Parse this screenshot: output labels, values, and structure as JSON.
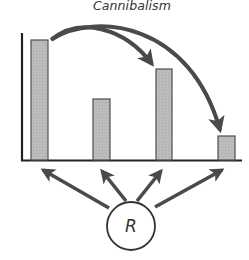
{
  "diagram": {
    "title": "Cannibalism",
    "resource_node": {
      "label": "R"
    },
    "colors": {
      "bar_fill": "#b9b9b9",
      "bar_stroke": "#4f4f4f",
      "arrow": "#4a4a4a",
      "axis": "#222222",
      "text": "#333333"
    },
    "bars": [
      {
        "id": "bar-1",
        "relative_height": 120
      },
      {
        "id": "bar-2",
        "relative_height": 61
      },
      {
        "id": "bar-3",
        "relative_height": 91
      },
      {
        "id": "bar-4",
        "relative_height": 24
      }
    ],
    "curved_arrows": [
      {
        "from": "bar-1",
        "to": "bar-3"
      },
      {
        "from": "bar-1",
        "to": "bar-4"
      }
    ],
    "straight_arrows": [
      {
        "from": "R",
        "to": "bar-1"
      },
      {
        "from": "R",
        "to": "bar-2"
      },
      {
        "from": "R",
        "to": "bar-3"
      },
      {
        "from": "R",
        "to": "bar-4"
      }
    ]
  }
}
